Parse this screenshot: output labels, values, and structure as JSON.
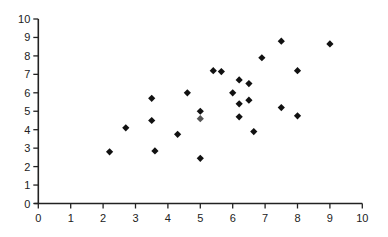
{
  "chart_data": {
    "type": "scatter",
    "title": "",
    "xlabel": "",
    "ylabel": "",
    "xlim": [
      0,
      10
    ],
    "ylim": [
      0,
      10
    ],
    "grid": false,
    "legend": null,
    "x_ticks": [
      0,
      1,
      2,
      3,
      4,
      5,
      6,
      7,
      8,
      9,
      10
    ],
    "y_ticks": [
      0,
      1,
      2,
      3,
      4,
      5,
      6,
      7,
      8,
      9,
      10
    ],
    "marker": "diamond",
    "marker_color": "#111111",
    "points": [
      {
        "x": 2.2,
        "y": 2.8
      },
      {
        "x": 2.7,
        "y": 4.1
      },
      {
        "x": 3.5,
        "y": 5.7
      },
      {
        "x": 3.5,
        "y": 4.5
      },
      {
        "x": 3.6,
        "y": 2.85
      },
      {
        "x": 4.3,
        "y": 3.75
      },
      {
        "x": 4.6,
        "y": 6.0
      },
      {
        "x": 5.0,
        "y": 5.0
      },
      {
        "x": 5.0,
        "y": 4.6,
        "color": "#555555"
      },
      {
        "x": 5.0,
        "y": 2.45
      },
      {
        "x": 5.4,
        "y": 7.2
      },
      {
        "x": 5.65,
        "y": 7.15
      },
      {
        "x": 6.0,
        "y": 6.0
      },
      {
        "x": 6.2,
        "y": 6.7
      },
      {
        "x": 6.2,
        "y": 5.4
      },
      {
        "x": 6.2,
        "y": 4.7
      },
      {
        "x": 6.5,
        "y": 6.5
      },
      {
        "x": 6.5,
        "y": 5.6
      },
      {
        "x": 6.65,
        "y": 3.9
      },
      {
        "x": 6.9,
        "y": 7.9
      },
      {
        "x": 7.5,
        "y": 8.8
      },
      {
        "x": 7.5,
        "y": 5.2
      },
      {
        "x": 8.0,
        "y": 7.2
      },
      {
        "x": 8.0,
        "y": 4.75
      },
      {
        "x": 9.0,
        "y": 8.65
      }
    ]
  }
}
